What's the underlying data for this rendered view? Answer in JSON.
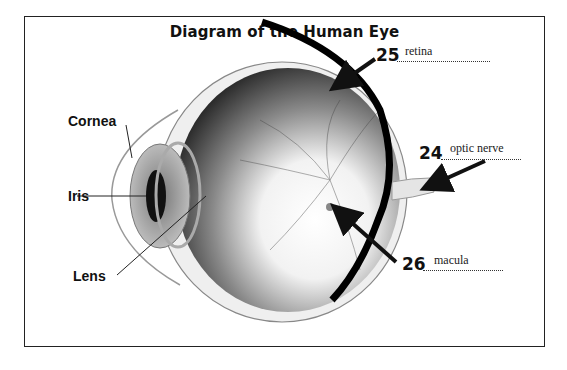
{
  "diagram": {
    "title": "Diagram of the Human Eye",
    "labels": {
      "cornea": "Cornea",
      "iris": "Iris",
      "lens": "Lens"
    },
    "questions": [
      {
        "number": "25",
        "answer": "retina"
      },
      {
        "number": "24",
        "answer": "optic nerve"
      },
      {
        "number": "26",
        "answer": "macula"
      }
    ]
  }
}
